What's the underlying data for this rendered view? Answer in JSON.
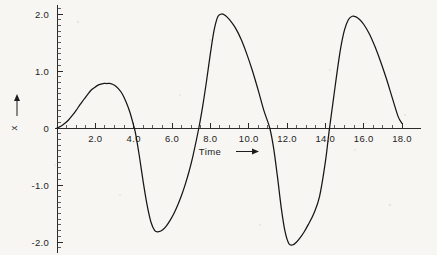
{
  "figure": {
    "background_color": "#f7f6f3",
    "line_color": "#161616"
  },
  "chart_data": {
    "type": "line",
    "title": "",
    "subtitle": "",
    "xlabel": "Time",
    "xlabel_suffix": "⟶",
    "ylabel": "x",
    "ylabel_suffix": "↑",
    "grid": false,
    "legend": null,
    "xlim": [
      0,
      19.0
    ],
    "ylim": [
      -2.2,
      2.15
    ],
    "x_major_step": 2.0,
    "x_minor_step": 0.5,
    "y_major_step": 1.0,
    "y_minor_step": 0.1,
    "x_tick_labels": [
      "2.0",
      "4.0",
      "6.0",
      "8.0",
      "10.0",
      "12.0",
      "14.0",
      "16.0",
      "18.0"
    ],
    "x_tick_values": [
      2.0,
      4.0,
      6.0,
      8.0,
      10.0,
      12.0,
      14.0,
      16.0,
      18.0
    ],
    "y_tick_labels": [
      "2.0",
      "1.0",
      "0",
      "-1.0",
      "-2.0"
    ],
    "y_tick_values": [
      2.0,
      1.0,
      0,
      -1.0,
      -2.0
    ],
    "annotations": {
      "peaks": [
        {
          "x": 2.8,
          "y": 0.78
        },
        {
          "x": 8.4,
          "y": 2.0
        },
        {
          "x": 15.4,
          "y": 1.97
        }
      ],
      "troughs": [
        {
          "x": 5.1,
          "y": -1.82
        },
        {
          "x": 12.1,
          "y": -2.05
        }
      ],
      "zero_crossings": [
        0.0,
        4.1,
        7.4,
        11.1,
        14.2
      ],
      "endpoint": {
        "x": 18.0,
        "y": 0.08
      }
    },
    "series": [
      {
        "name": "x(t)",
        "x": [
          0.0,
          0.2,
          0.4,
          0.6,
          0.8,
          1.0,
          1.2,
          1.4,
          1.6,
          1.8,
          2.0,
          2.2,
          2.4,
          2.6,
          2.8,
          3.0,
          3.2,
          3.4,
          3.6,
          3.8,
          4.0,
          4.1,
          4.3,
          4.5,
          4.7,
          4.9,
          5.1,
          5.3,
          5.5,
          5.7,
          5.9,
          6.1,
          6.3,
          6.5,
          6.7,
          6.9,
          7.1,
          7.4,
          7.6,
          7.8,
          8.0,
          8.2,
          8.4,
          8.6,
          8.8,
          9.0,
          9.3,
          9.6,
          9.9,
          10.2,
          10.5,
          10.8,
          11.1,
          11.3,
          11.5,
          11.7,
          11.9,
          12.1,
          12.3,
          12.5,
          12.7,
          12.9,
          13.1,
          13.4,
          13.7,
          14.0,
          14.2,
          14.4,
          14.6,
          14.8,
          15.0,
          15.2,
          15.4,
          15.6,
          15.8,
          16.0,
          16.3,
          16.6,
          16.9,
          17.2,
          17.5,
          17.8,
          18.0
        ],
        "y": [
          0.0,
          0.03,
          0.08,
          0.14,
          0.22,
          0.31,
          0.41,
          0.5,
          0.59,
          0.67,
          0.72,
          0.76,
          0.78,
          0.78,
          0.78,
          0.75,
          0.69,
          0.6,
          0.46,
          0.28,
          0.04,
          -0.1,
          -0.5,
          -0.95,
          -1.35,
          -1.65,
          -1.8,
          -1.82,
          -1.79,
          -1.72,
          -1.62,
          -1.5,
          -1.35,
          -1.18,
          -0.98,
          -0.75,
          -0.48,
          0.0,
          0.38,
          0.82,
          1.3,
          1.72,
          1.96,
          2.0,
          1.97,
          1.9,
          1.76,
          1.56,
          1.3,
          1.0,
          0.66,
          0.3,
          0.0,
          -0.35,
          -0.85,
          -1.4,
          -1.82,
          -2.03,
          -2.05,
          -2.0,
          -1.92,
          -1.82,
          -1.7,
          -1.5,
          -1.2,
          -0.6,
          -0.05,
          0.45,
          0.95,
          1.4,
          1.72,
          1.9,
          1.96,
          1.95,
          1.9,
          1.82,
          1.65,
          1.42,
          1.15,
          0.85,
          0.52,
          0.2,
          0.08
        ]
      }
    ]
  }
}
